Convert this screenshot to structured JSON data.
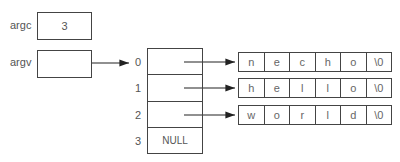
{
  "variables": [
    {
      "name": "argc",
      "value": "3"
    },
    {
      "name": "argv",
      "value": ""
    }
  ],
  "array": {
    "indices": [
      "0",
      "1",
      "2",
      "3"
    ],
    "values": [
      "",
      "",
      "",
      "NULL"
    ]
  },
  "strings": [
    {
      "chars": [
        "n",
        "e",
        "c",
        "h",
        "o",
        "\\0"
      ]
    },
    {
      "chars": [
        "h",
        "e",
        "l",
        "l",
        "o",
        "\\0"
      ]
    },
    {
      "chars": [
        "w",
        "o",
        "r",
        "l",
        "d",
        "\\0"
      ]
    }
  ],
  "colors": {
    "line": "#333333",
    "text": "#555555"
  }
}
